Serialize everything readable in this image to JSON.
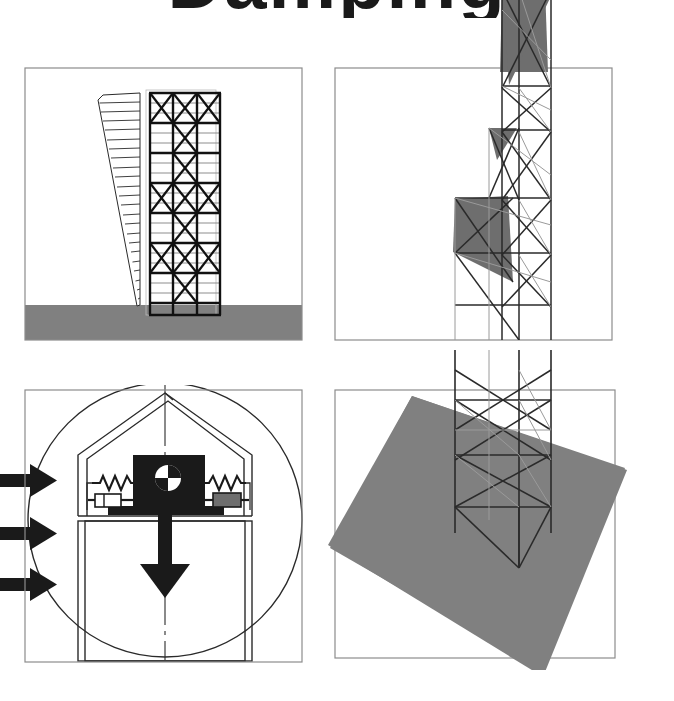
{
  "figure": {
    "title_fragment": "Damping",
    "background_color": "#ffffff",
    "ink_color": "#1a1a1a",
    "ground_gray": "#808080",
    "frame_gray": "#8c8c8c",
    "panel_count": 4
  },
  "panels": {
    "top_left": {
      "name": "braced-frame-elevation",
      "caption": "",
      "bounds": {
        "x": 25,
        "y": 68,
        "w": 277,
        "h": 272
      },
      "ground": {
        "color": "#808080",
        "top_y": 305
      },
      "tower": {
        "label": "",
        "bays": 3,
        "floors": 22,
        "bracing": "x-bracing",
        "x": 150,
        "y": 93,
        "w": 70,
        "h": 222
      },
      "deflection_diagram": {
        "label": "",
        "hatch_lines": 22,
        "top_width": 44,
        "base_width": 0
      }
    },
    "bottom_left": {
      "name": "tuned-mass-damper-detail",
      "caption": "",
      "bounds": {
        "x": 25,
        "y": 390,
        "w": 277,
        "h": 272
      },
      "circle": {
        "cx": 165,
        "cy": 520,
        "r": 135
      },
      "mass_block": {
        "label": "",
        "color": "#1a1a1a",
        "x": 133,
        "y": 455,
        "w": 72,
        "h": 52
      },
      "cg_symbol": {
        "name": "center-of-gravity-icon",
        "cx": 168,
        "cy": 478,
        "r": 13
      },
      "springs": {
        "count": 2,
        "coils": 7
      },
      "dashpots": {
        "count": 2
      },
      "load_arrows": {
        "name": "lateral-load-arrows",
        "count": 3,
        "direction": "right",
        "color": "#1a1a1a"
      },
      "gravity_arrow": {
        "name": "gravity-arrow",
        "direction": "down",
        "color": "#1a1a1a"
      },
      "centerline": {
        "style": "dash-dot"
      }
    },
    "top_right": {
      "name": "three-d-tower-upper",
      "caption": "",
      "bounds": {
        "x": 335,
        "y": 68,
        "w": 277,
        "h": 272
      },
      "shaded_faces": 3,
      "shade_color": "#6e6e6e"
    },
    "bottom_right": {
      "name": "three-d-tower-base-on-ground",
      "caption": "",
      "bounds": {
        "x": 335,
        "y": 390,
        "w": 280,
        "h": 268
      },
      "ground_plane": {
        "color": "#808080",
        "rotation_deg": -16
      },
      "shaded_faces": 1
    }
  }
}
